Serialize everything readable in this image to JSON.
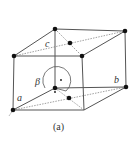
{
  "figure": {
    "caption": "(a)",
    "labels": {
      "a": "a",
      "b": "b",
      "c": "c",
      "beta": "β"
    },
    "colors": {
      "edge": "#555555",
      "atom": "#111111",
      "background": "#ffffff"
    }
  }
}
